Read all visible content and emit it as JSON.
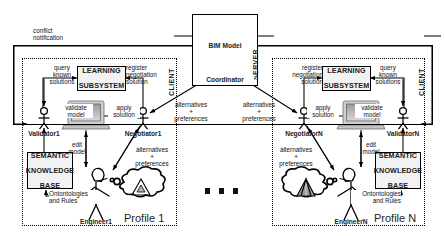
{
  "diagram": {
    "server": {
      "zone_label": "SERVER",
      "bim_model_label": "BIM Model",
      "coordinator_label": "Coordinator"
    },
    "conflict": {
      "line1": "conflict",
      "line2": "notification"
    },
    "ellipsis": "...",
    "profiles": [
      {
        "id": "profile-1",
        "title": "Profile 1",
        "zone_label": "CLIENT",
        "learning_subsystem": {
          "line1": "LEARNING",
          "line2": "SUBSYSTEM"
        },
        "semantic_kb": {
          "line1": "SEMANTIC",
          "line2": "KNOWLEDGE",
          "line3": "BASE"
        },
        "validator_label": "Validator1",
        "negotiator_label": "Negotiator1",
        "engineer_label": "Engineer1",
        "edges": {
          "query_known_solutions": "query\nknown\nsolutions",
          "register_negotiation_solution": "register\nnegotiation\nsolution",
          "validate_model": "validate\nmodel",
          "apply_solution": "apply\nsolution",
          "edit_model": "edit\nmodel",
          "ontologies_and_rules": "Ontontologies\nand Rules",
          "alternatives_preferences": "alternatives\n+\npreferences",
          "alternatives_preferences_server": "alternatives\n+\npreferences"
        }
      },
      {
        "id": "profile-n",
        "title": "Profile N",
        "zone_label": "CLIENT",
        "learning_subsystem": {
          "line1": "LEARNING",
          "line2": "SUBSYSTEM"
        },
        "semantic_kb": {
          "line1": "SEMANTIC",
          "line2": "KNOWLEDGE",
          "line3": "BASE"
        },
        "validator_label": "ValidatorN",
        "negotiator_label": "NegotiatorN",
        "engineer_label": "EngineerN",
        "edges": {
          "query_known_solutions": "query\nknown\nsolutions",
          "register_negotiation_solution": "register\nnegotiation\nsolution",
          "validate_model": "validate\nmodel",
          "apply_solution": "apply\nsolution",
          "edit_model": "edit\nmodel",
          "ontologies_and_rules": "Ontontologies\nand Rules",
          "alternatives_preferences": "alternatives\n+\npreferences",
          "alternatives_preferences_server": "alternatives\n+\npreferences"
        }
      }
    ],
    "colors": {
      "line": "#000000",
      "box_fill": "#f2f2f2",
      "background": "#ffffff",
      "device_gray": "#b9b9b9"
    }
  }
}
